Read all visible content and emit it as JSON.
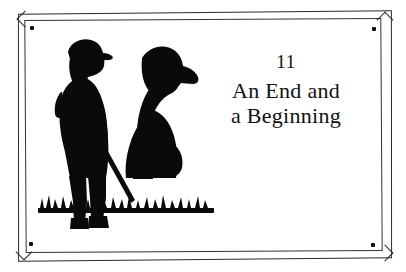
{
  "illustration": {
    "kind": "silhouette-plaque",
    "caption_alt": "black silhouette of a man in a flat cap with a walking stick standing beside a seated dog on grass",
    "figures": [
      {
        "name": "man-with-walking-stick",
        "label": "man in flat cap"
      },
      {
        "name": "seated-dog",
        "label": "seated dog"
      },
      {
        "name": "grass-ground",
        "label": "grass"
      }
    ],
    "colors": {
      "silhouette": "#0a0a0a",
      "plate_background": "#ffffff",
      "frame_line": "#2b2b2b",
      "screw_dot": "#111111",
      "text": "#111111"
    },
    "frame": {
      "screws": [
        "top-left",
        "top-right",
        "bottom-left",
        "bottom-right"
      ]
    }
  },
  "chapter": {
    "number": "11",
    "title_lines": [
      "An End and",
      "a Beginning"
    ],
    "title_full": "An End and a Beginning"
  }
}
